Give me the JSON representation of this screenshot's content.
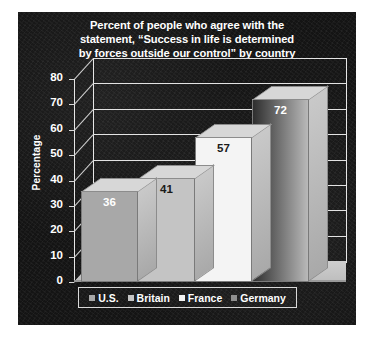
{
  "chart_data": {
    "type": "bar",
    "title": "Percent of people who agree with the statement, “Success in life is determined by forces outside our control” by country",
    "title_lines": [
      "Percent of people who agree with the",
      "statement, “Success in life is determined",
      "by forces outside our control” by country"
    ],
    "categories": [
      "U.S.",
      "Britain",
      "France",
      "Germany"
    ],
    "values": [
      36,
      41,
      57,
      72
    ],
    "xlabel": "",
    "ylabel": "Percentage",
    "ylim": [
      0,
      80
    ],
    "ytick_labels": [
      "80",
      "70",
      "60",
      "50",
      "40",
      "30",
      "20",
      "10",
      "0"
    ],
    "ytick_values": [
      80,
      70,
      60,
      50,
      40,
      30,
      20,
      10,
      0
    ],
    "grid": true,
    "legend_position": "bottom",
    "legend_entries": [
      {
        "label": "U.S.",
        "color": "#a8a8a8"
      },
      {
        "label": "Britain",
        "color": "#c4c4c4"
      },
      {
        "label": "France",
        "color": "#f2f2f2"
      },
      {
        "label": "Germany",
        "color": "#8f8f8f"
      }
    ],
    "series": [
      {
        "name": "Percentage",
        "points": [
          {
            "category": "U.S.",
            "value": 36,
            "label": "36",
            "fill": "#a8a8a8",
            "label_color": "#ffffff"
          },
          {
            "category": "Britain",
            "value": 41,
            "label": "41",
            "fill": "#c4c4c4",
            "label_color": "#1a1a1a"
          },
          {
            "category": "France",
            "value": 57,
            "label": "57",
            "fill": "#f4f4f4",
            "label_color": "#1a1a1a"
          },
          {
            "category": "Germany",
            "value": 72,
            "label": "72",
            "fill": "#8f8f8f",
            "label_color": "#ffffff"
          }
        ]
      }
    ]
  },
  "colors": {
    "panel_background": "#141414",
    "text": "#ffffff",
    "gridline": "#e3e3e3",
    "floor": "#cfcfcf"
  }
}
